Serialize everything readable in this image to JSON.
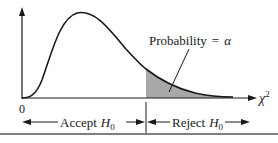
{
  "figure": {
    "type": "chi-square rejection region diagram",
    "origin_label": "0",
    "x_axis_label": "χ",
    "x_axis_superscript": "2",
    "annotation": {
      "prefix": "Probability",
      "equals": "=",
      "symbol": "α"
    },
    "accept_region": {
      "word": "Accept",
      "hypothesis": "H",
      "subscript": "0"
    },
    "reject_region": {
      "word": "Reject",
      "hypothesis": "H",
      "subscript": "0"
    },
    "colors": {
      "curve": "#1a1a1a",
      "shaded_tail": "#a8a8a8",
      "rule": "#555555"
    }
  }
}
